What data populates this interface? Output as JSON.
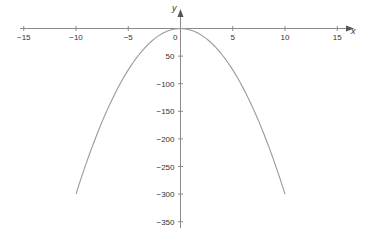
{
  "chart_data": {
    "type": "line",
    "title": "",
    "xlabel": "x",
    "ylabel": "y",
    "xlim": [
      -15,
      15
    ],
    "ylim": [
      -350,
      0
    ],
    "grid": false,
    "legend": null,
    "x_ticks": [
      -15,
      -10,
      -5,
      0,
      5,
      10,
      15
    ],
    "x_tick_labels": [
      "−15",
      "−10",
      "−5",
      "0",
      "5",
      "10",
      "15"
    ],
    "y_ticks": [
      -50,
      -100,
      -150,
      -200,
      -250,
      -300,
      -350
    ],
    "y_tick_labels": [
      "50",
      "−100",
      "−150",
      "−200",
      "−250",
      "−300",
      "−350"
    ],
    "series": [
      {
        "name": "y = −3x²",
        "x": [
          -10,
          -8,
          -6,
          -4,
          -2,
          0,
          2,
          4,
          6,
          8,
          10
        ],
        "y": [
          -300,
          -192,
          -108,
          -48,
          -12,
          0,
          -12,
          -48,
          -108,
          -192,
          -300
        ]
      }
    ],
    "colors": {
      "axis": "#8a8a8a",
      "curve": "#9a9a9a",
      "text": "#333333"
    }
  }
}
